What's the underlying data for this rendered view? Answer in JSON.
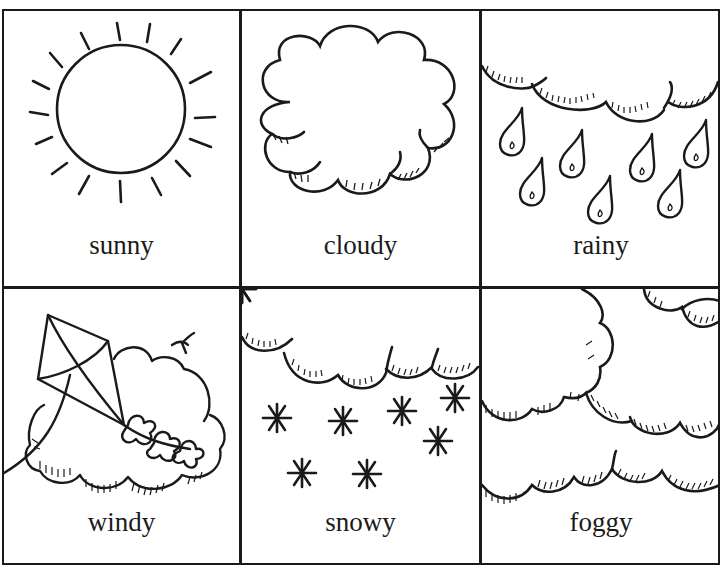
{
  "cells": [
    {
      "id": "sunny",
      "label": "sunny",
      "icon": "sun-icon"
    },
    {
      "id": "cloudy",
      "label": "cloudy",
      "icon": "cloud-icon"
    },
    {
      "id": "rainy",
      "label": "rainy",
      "icon": "rain-icon"
    },
    {
      "id": "windy",
      "label": "windy",
      "icon": "kite-cloud-icon"
    },
    {
      "id": "snowy",
      "label": "snowy",
      "icon": "snow-icon"
    },
    {
      "id": "foggy",
      "label": "foggy",
      "icon": "fog-icon"
    }
  ],
  "colors": {
    "ink": "#1a1a1a",
    "paper": "#ffffff"
  }
}
